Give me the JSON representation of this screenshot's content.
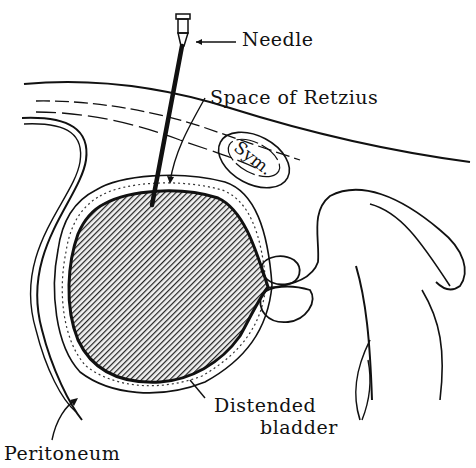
{
  "diagram": {
    "labels": {
      "needle": "Needle",
      "space_of_retzius": "Space of Retzius",
      "symphysis": "Sym.",
      "distended": "Distended",
      "bladder": "bladder",
      "peritoneum": "Peritoneum"
    },
    "colors": {
      "ink": "#111111",
      "background": "#ffffff",
      "bladder_fill": "#555555"
    }
  }
}
